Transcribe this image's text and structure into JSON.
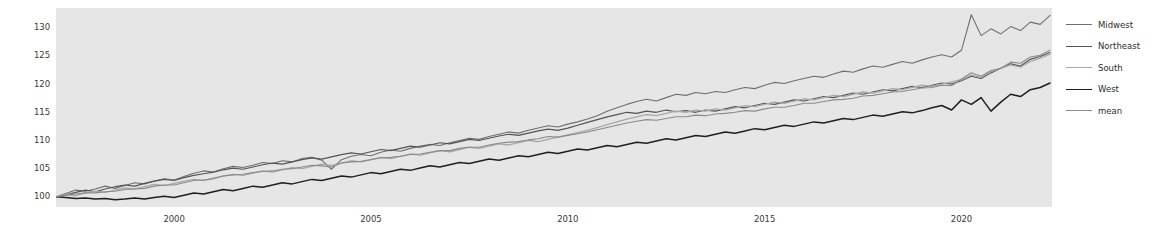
{
  "chart_data": {
    "type": "line",
    "title": "",
    "xlabel": "",
    "ylabel": "",
    "xlim": [
      1997.0,
      2022.3
    ],
    "ylim": [
      98.2,
      133.5
    ],
    "grid": false,
    "legend_position": "right-outside",
    "x_ticks": [
      "2000",
      "2005",
      "2010",
      "2015",
      "2020"
    ],
    "x_tick_values": [
      2000,
      2005,
      2010,
      2015,
      2020
    ],
    "y_ticks": [
      "100",
      "105",
      "110",
      "115",
      "120",
      "125",
      "130"
    ],
    "y_tick_values": [
      100,
      105,
      110,
      115,
      120,
      125,
      130
    ],
    "x": [
      1997.0,
      1997.25,
      1997.5,
      1997.75,
      1998.0,
      1998.25,
      1998.5,
      1998.75,
      1999.0,
      1999.25,
      1999.5,
      1999.75,
      2000.0,
      2000.25,
      2000.5,
      2000.75,
      2001.0,
      2001.25,
      2001.5,
      2001.75,
      2002.0,
      2002.25,
      2002.5,
      2002.75,
      2003.0,
      2003.25,
      2003.5,
      2003.75,
      2004.0,
      2004.25,
      2004.5,
      2004.75,
      2005.0,
      2005.25,
      2005.5,
      2005.75,
      2006.0,
      2006.25,
      2006.5,
      2006.75,
      2007.0,
      2007.25,
      2007.5,
      2007.75,
      2008.0,
      2008.25,
      2008.5,
      2008.75,
      2009.0,
      2009.25,
      2009.5,
      2009.75,
      2010.0,
      2010.25,
      2010.5,
      2010.75,
      2011.0,
      2011.25,
      2011.5,
      2011.75,
      2012.0,
      2012.25,
      2012.5,
      2012.75,
      2013.0,
      2013.25,
      2013.5,
      2013.75,
      2014.0,
      2014.25,
      2014.5,
      2014.75,
      2015.0,
      2015.25,
      2015.5,
      2015.75,
      2016.0,
      2016.25,
      2016.5,
      2016.75,
      2017.0,
      2017.25,
      2017.5,
      2017.75,
      2018.0,
      2018.25,
      2018.5,
      2018.75,
      2019.0,
      2019.25,
      2019.5,
      2019.75,
      2020.0,
      2020.25,
      2020.5,
      2020.75,
      2021.0,
      2021.25,
      2021.5,
      2021.75,
      2022.0,
      2022.25
    ],
    "series": [
      {
        "name": "Midwest",
        "color": "#6f6f6f",
        "width": 1.1,
        "values": [
          100.0,
          100.6,
          101.2,
          101.0,
          101.4,
          101.9,
          101.5,
          102.0,
          102.5,
          102.3,
          102.8,
          103.2,
          103.0,
          103.6,
          104.2,
          104.6,
          104.4,
          105.0,
          105.4,
          105.2,
          105.6,
          106.1,
          105.9,
          106.4,
          106.2,
          106.8,
          107.0,
          106.5,
          104.9,
          106.6,
          107.2,
          107.5,
          107.3,
          107.9,
          108.3,
          108.1,
          108.6,
          109.0,
          109.3,
          109.1,
          109.6,
          110.0,
          110.4,
          110.2,
          110.7,
          111.1,
          111.5,
          111.3,
          111.8,
          112.2,
          112.6,
          112.4,
          112.9,
          113.3,
          113.8,
          114.4,
          115.2,
          115.8,
          116.4,
          116.9,
          117.3,
          117.0,
          117.6,
          118.2,
          118.0,
          118.5,
          118.3,
          118.7,
          118.5,
          119.0,
          119.4,
          119.2,
          119.8,
          120.3,
          120.1,
          120.6,
          121.0,
          121.4,
          121.2,
          121.8,
          122.3,
          122.1,
          122.7,
          123.2,
          123.0,
          123.5,
          124.0,
          123.7,
          124.3,
          124.8,
          125.2,
          124.8,
          126.0,
          132.3,
          128.6,
          129.8,
          128.9,
          130.2,
          129.5,
          131.0,
          130.6,
          132.2
        ]
      },
      {
        "name": "Northeast",
        "color": "#545454",
        "width": 1.2,
        "values": [
          100.0,
          100.3,
          100.8,
          101.2,
          100.9,
          101.4,
          101.8,
          102.1,
          101.9,
          102.4,
          102.8,
          103.1,
          102.9,
          103.4,
          103.8,
          104.1,
          104.4,
          104.8,
          105.1,
          104.9,
          105.3,
          105.7,
          106.0,
          105.8,
          106.2,
          106.6,
          106.9,
          106.7,
          107.1,
          107.5,
          107.8,
          107.6,
          108.0,
          108.4,
          108.2,
          108.6,
          109.0,
          108.8,
          109.2,
          109.6,
          109.4,
          109.8,
          110.2,
          110.0,
          110.4,
          110.8,
          111.1,
          110.9,
          111.3,
          111.7,
          112.0,
          111.8,
          112.2,
          112.7,
          113.2,
          113.7,
          114.2,
          114.6,
          115.0,
          114.8,
          115.2,
          115.0,
          115.4,
          115.1,
          115.3,
          115.0,
          115.4,
          115.2,
          115.6,
          116.0,
          115.8,
          116.2,
          116.6,
          116.4,
          116.8,
          117.2,
          117.0,
          117.4,
          117.8,
          117.6,
          118.0,
          118.4,
          118.2,
          118.6,
          119.0,
          118.8,
          119.2,
          119.6,
          119.4,
          119.8,
          120.2,
          120.0,
          120.6,
          121.4,
          121.0,
          122.0,
          122.8,
          123.6,
          123.2,
          124.4,
          124.9,
          125.6
        ]
      },
      {
        "name": "South",
        "color": "#a8a8a8",
        "width": 1.3,
        "values": [
          100.0,
          100.4,
          100.2,
          100.7,
          101.0,
          100.8,
          101.2,
          101.6,
          101.4,
          101.8,
          102.2,
          102.0,
          102.4,
          102.8,
          103.1,
          102.9,
          103.3,
          103.7,
          104.0,
          103.8,
          104.2,
          104.6,
          104.4,
          104.8,
          105.2,
          105.0,
          105.4,
          105.8,
          105.6,
          106.0,
          106.4,
          106.2,
          106.6,
          107.0,
          106.8,
          107.2,
          107.6,
          107.4,
          107.8,
          108.2,
          108.0,
          108.4,
          108.8,
          108.6,
          109.0,
          109.4,
          109.2,
          109.6,
          110.0,
          109.8,
          110.2,
          110.6,
          111.0,
          111.4,
          111.8,
          112.3,
          112.8,
          113.3,
          113.8,
          114.2,
          114.6,
          114.4,
          114.8,
          115.2,
          115.0,
          115.4,
          115.2,
          115.6,
          115.4,
          115.8,
          116.2,
          116.0,
          116.4,
          116.8,
          116.6,
          117.0,
          117.4,
          117.2,
          117.6,
          118.0,
          117.8,
          118.2,
          118.6,
          118.4,
          118.8,
          119.2,
          119.0,
          119.4,
          119.8,
          119.6,
          120.0,
          120.4,
          120.8,
          121.6,
          121.2,
          122.2,
          122.8,
          123.4,
          123.0,
          124.0,
          124.6,
          125.3
        ]
      },
      {
        "name": "West",
        "color": "#1f1f1f",
        "width": 1.5,
        "values": [
          100.0,
          99.9,
          99.7,
          99.8,
          99.6,
          99.7,
          99.5,
          99.6,
          99.8,
          99.6,
          99.9,
          100.1,
          99.9,
          100.3,
          100.7,
          100.5,
          100.9,
          101.3,
          101.1,
          101.5,
          101.9,
          101.7,
          102.1,
          102.5,
          102.3,
          102.7,
          103.1,
          102.9,
          103.3,
          103.7,
          103.5,
          103.9,
          104.3,
          104.1,
          104.5,
          104.9,
          104.7,
          105.1,
          105.5,
          105.3,
          105.7,
          106.1,
          105.9,
          106.3,
          106.7,
          106.5,
          106.9,
          107.3,
          107.1,
          107.5,
          107.9,
          107.7,
          108.1,
          108.5,
          108.3,
          108.7,
          109.1,
          108.9,
          109.3,
          109.7,
          109.5,
          109.9,
          110.3,
          110.1,
          110.5,
          110.9,
          110.7,
          111.1,
          111.5,
          111.3,
          111.7,
          112.1,
          111.9,
          112.3,
          112.7,
          112.5,
          112.9,
          113.3,
          113.1,
          113.5,
          113.9,
          113.7,
          114.1,
          114.5,
          114.3,
          114.7,
          115.1,
          114.9,
          115.3,
          115.8,
          116.2,
          115.4,
          117.2,
          116.4,
          117.6,
          115.2,
          116.8,
          118.2,
          117.8,
          119.0,
          119.4,
          120.2
        ]
      },
      {
        "name": "mean",
        "color": "#8b8b8b",
        "width": 1.1,
        "values": [
          100.0,
          100.3,
          100.5,
          100.7,
          100.7,
          100.9,
          101.0,
          101.3,
          101.4,
          101.5,
          101.9,
          102.1,
          102.1,
          102.5,
          102.9,
          103.0,
          103.2,
          103.7,
          103.9,
          104.0,
          104.3,
          104.5,
          104.6,
          104.9,
          105.0,
          105.3,
          105.6,
          105.5,
          105.3,
          106.0,
          106.2,
          106.3,
          106.6,
          106.9,
          107.0,
          107.2,
          107.5,
          107.6,
          107.9,
          108.2,
          108.2,
          108.6,
          108.8,
          108.8,
          109.2,
          109.5,
          109.7,
          109.8,
          110.1,
          110.3,
          110.7,
          110.6,
          110.9,
          111.2,
          111.5,
          111.9,
          112.3,
          112.7,
          113.1,
          113.4,
          113.7,
          113.6,
          113.9,
          114.2,
          114.2,
          114.5,
          114.4,
          114.7,
          114.8,
          115.0,
          115.3,
          115.2,
          115.6,
          115.9,
          115.9,
          116.2,
          116.6,
          116.6,
          116.9,
          117.2,
          117.3,
          117.5,
          117.9,
          118.0,
          118.3,
          118.6,
          118.7,
          119.0,
          119.3,
          119.4,
          119.8,
          119.7,
          120.9,
          122.0,
          121.4,
          122.4,
          122.8,
          123.9,
          123.7,
          124.8,
          125.1,
          126.0
        ]
      }
    ]
  },
  "legend": {
    "items": [
      {
        "label": "Midwest"
      },
      {
        "label": "Northeast"
      },
      {
        "label": "South"
      },
      {
        "label": "West"
      },
      {
        "label": "mean"
      }
    ]
  },
  "colors": {
    "plot_background": "#e6e6e6",
    "figure_background": "#ffffff",
    "tick_text": "#3a3a3a"
  }
}
